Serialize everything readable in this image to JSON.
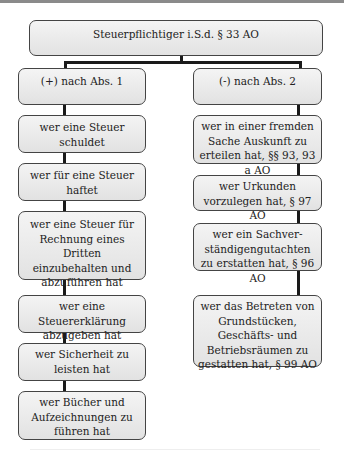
{
  "diagram": {
    "root": "Steuerpflichtiger i.S.d. § 33 AO",
    "left": {
      "header": "(+) nach Abs. 1",
      "items": [
        "wer eine Steuer schuldet",
        "wer für eine Steuer haftet",
        "wer eine Steuer für Rechnung eines Dritten einzubehalten und abzuführen hat",
        "wer eine Steuererklärung abzugeben hat",
        "wer Sicherheit zu leisten hat",
        "wer Bücher und Aufzeichnungen zu führen hat"
      ]
    },
    "right": {
      "header": "(-) nach Abs. 2",
      "items": [
        "wer in einer fremden Sache Auskunft zu erteilen hat, §§ 93, 93 a AO",
        "wer Urkunden vorzulegen hat, § 97 AO",
        "wer ein Sachver-ständigengutachten zu erstatten hat, § 96 AO",
        "wer das Betreten von Grundstücken, Geschäfts- und Betriebsräumen zu gestatten hat, § 99 AO"
      ]
    }
  }
}
